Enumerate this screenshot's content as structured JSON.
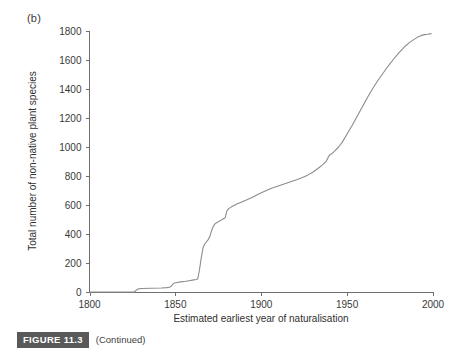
{
  "figure": {
    "panel_label": "(b)",
    "caption_badge": "FIGURE 11.3",
    "caption_text": "(Continued)"
  },
  "chart_data": {
    "type": "line",
    "title": "",
    "panel": "(b)",
    "xlabel": "Estimated earliest year of  naturalisation",
    "ylabel": "Total number of non-native plant species",
    "xlim": [
      1800,
      2000
    ],
    "ylim": [
      0,
      1800
    ],
    "xticks": [
      1800,
      1850,
      1900,
      1950,
      2000
    ],
    "xticklabels": [
      "1800",
      "1850",
      "1900",
      "1950",
      "2000"
    ],
    "yticks": [
      0,
      200,
      400,
      600,
      800,
      1000,
      1200,
      1400,
      1600,
      1800
    ],
    "yticklabels": [
      "0",
      "200",
      "400",
      "600",
      "800",
      "1000",
      "1200",
      "1400",
      "1600",
      "1800"
    ],
    "grid": false,
    "legend": null,
    "line_color": "#8c8c8c",
    "series": [
      {
        "name": "Cumulative non-native plant species",
        "x": [
          1800,
          1820,
          1826,
          1828,
          1830,
          1836,
          1842,
          1845,
          1847,
          1849,
          1851,
          1853,
          1856,
          1858,
          1860,
          1862,
          1863,
          1864,
          1865,
          1866,
          1867,
          1868,
          1869,
          1870,
          1871,
          1872,
          1873,
          1874,
          1875,
          1876,
          1877,
          1878,
          1879,
          1880,
          1881,
          1882,
          1883,
          1884,
          1885,
          1886,
          1888,
          1890,
          1892,
          1894,
          1896,
          1898,
          1900,
          1903,
          1906,
          1909,
          1912,
          1915,
          1918,
          1921,
          1924,
          1927,
          1930,
          1933,
          1936,
          1938,
          1939,
          1940,
          1941,
          1943,
          1945,
          1947,
          1950,
          1953,
          1956,
          1959,
          1962,
          1965,
          1968,
          1971,
          1974,
          1977,
          1980,
          1983,
          1986,
          1989,
          1991,
          1993,
          1995,
          1997,
          1998,
          1999
        ],
        "y": [
          0,
          0,
          0,
          20,
          24,
          26,
          28,
          30,
          34,
          60,
          66,
          70,
          74,
          78,
          82,
          86,
          90,
          150,
          230,
          300,
          330,
          345,
          360,
          380,
          420,
          450,
          470,
          478,
          484,
          492,
          498,
          505,
          512,
          560,
          575,
          582,
          590,
          596,
          602,
          608,
          618,
          628,
          638,
          648,
          660,
          672,
          684,
          700,
          715,
          728,
          740,
          752,
          764,
          776,
          790,
          806,
          826,
          852,
          880,
          905,
          930,
          948,
          952,
          975,
          1000,
          1030,
          1090,
          1150,
          1215,
          1280,
          1345,
          1405,
          1460,
          1510,
          1560,
          1605,
          1648,
          1686,
          1718,
          1742,
          1758,
          1768,
          1775,
          1778,
          1780,
          1781
        ]
      }
    ]
  }
}
